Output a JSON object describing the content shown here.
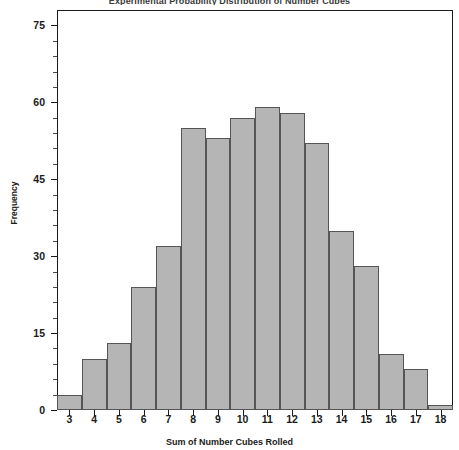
{
  "chart_data": {
    "type": "bar",
    "title": "Experimental Probability Distribution of Number Cubes",
    "xlabel": "Sum of Number Cubes Rolled",
    "ylabel": "Frequency",
    "categories": [
      "3",
      "4",
      "5",
      "6",
      "7",
      "8",
      "9",
      "10",
      "11",
      "12",
      "13",
      "14",
      "15",
      "16",
      "17",
      "18"
    ],
    "values": [
      3,
      10,
      13,
      24,
      32,
      55,
      53,
      57,
      59,
      58,
      52,
      35,
      28,
      11,
      8,
      1
    ],
    "ylim": [
      0,
      78
    ],
    "xlim": [
      2.5,
      18.5
    ],
    "y_ticks": [
      0,
      15,
      30,
      45,
      60,
      75
    ],
    "y_minor_tick_step": 3,
    "grid": false,
    "legend": false,
    "bar_fill_color": "#b5b5b5",
    "bar_border_color": "#555555",
    "axis_color": "#1a1a1a",
    "background_color": "#ffffff"
  },
  "axes": {
    "y_label": "Frequency",
    "x_label": "Sum of Number Cubes Rolled",
    "y_tick_labels": [
      "0",
      "15",
      "30",
      "45",
      "60",
      "75"
    ],
    "x_tick_labels": [
      "3",
      "4",
      "5",
      "6",
      "7",
      "8",
      "9",
      "10",
      "11",
      "12",
      "13",
      "14",
      "15",
      "16",
      "17",
      "18"
    ]
  },
  "header": {
    "title": "Experimental Probability Distribution of Number Cubes"
  }
}
